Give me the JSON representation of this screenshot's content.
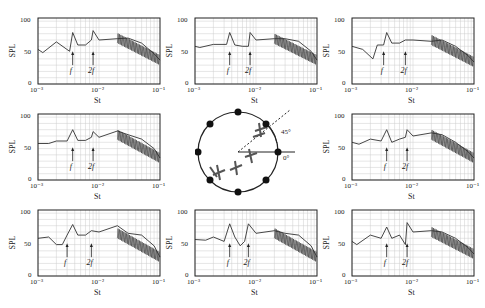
{
  "figure": {
    "xlabel": "St",
    "ylabel": "SPL",
    "yticks": [
      "0",
      "50",
      "100"
    ],
    "xticks": [
      "10⁻³",
      "10⁻²",
      "10⁻¹"
    ],
    "markers": [
      "f",
      "2f"
    ],
    "diagram": {
      "angle_label_45": "45°",
      "angle_label_0": "0°",
      "microphone_count": 8
    }
  },
  "chart_data": [
    {
      "type": "line",
      "title": "",
      "position": "top-left",
      "xlabel": "St",
      "ylabel": "SPL",
      "xscale": "log",
      "xlim": [
        0.001,
        0.1
      ],
      "ylim": [
        0,
        105
      ],
      "grid": true,
      "annotations": [
        "f",
        "2f"
      ],
      "x": [
        0.001,
        0.0012,
        0.002,
        0.0033,
        0.0037,
        0.0045,
        0.006,
        0.0075,
        0.008,
        0.01,
        0.02,
        0.03,
        0.05,
        0.08,
        0.1
      ],
      "y": [
        55,
        50,
        67,
        52,
        82,
        62,
        62,
        70,
        85,
        70,
        72,
        73,
        65,
        48,
        38
      ]
    },
    {
      "type": "line",
      "title": "",
      "position": "top-center",
      "xlabel": "St",
      "ylabel": "SPL",
      "xscale": "log",
      "xlim": [
        0.001,
        0.1
      ],
      "ylim": [
        0,
        105
      ],
      "grid": true,
      "annotations": [
        "f",
        "2f"
      ],
      "x": [
        0.001,
        0.0012,
        0.002,
        0.0033,
        0.0037,
        0.0045,
        0.006,
        0.0075,
        0.008,
        0.01,
        0.02,
        0.03,
        0.05,
        0.08,
        0.1
      ],
      "y": [
        60,
        58,
        63,
        63,
        82,
        62,
        60,
        60,
        82,
        70,
        72,
        72,
        68,
        52,
        38
      ]
    },
    {
      "type": "line",
      "title": "",
      "position": "top-right",
      "xlabel": "St",
      "ylabel": "SPL",
      "xscale": "log",
      "xlim": [
        0.001,
        0.1
      ],
      "ylim": [
        0,
        105
      ],
      "grid": true,
      "annotations": [
        "f",
        "2f"
      ],
      "x": [
        0.001,
        0.0015,
        0.0022,
        0.0026,
        0.0033,
        0.0037,
        0.0045,
        0.006,
        0.0075,
        0.01,
        0.02,
        0.03,
        0.05,
        0.08,
        0.1
      ],
      "y": [
        60,
        55,
        40,
        62,
        62,
        82,
        65,
        65,
        70,
        70,
        68,
        70,
        60,
        45,
        35
      ]
    },
    {
      "type": "line",
      "title": "",
      "position": "middle-left",
      "xlabel": "St",
      "ylabel": "SPL",
      "xscale": "log",
      "xlim": [
        0.001,
        0.1
      ],
      "ylim": [
        0,
        105
      ],
      "grid": true,
      "annotations": [
        "f",
        "2f"
      ],
      "x": [
        0.001,
        0.0015,
        0.002,
        0.003,
        0.0037,
        0.0045,
        0.006,
        0.0075,
        0.008,
        0.01,
        0.02,
        0.03,
        0.05,
        0.08,
        0.1
      ],
      "y": [
        58,
        58,
        62,
        62,
        80,
        63,
        63,
        68,
        77,
        68,
        78,
        72,
        65,
        50,
        35
      ]
    },
    {
      "type": "line",
      "title": "",
      "position": "middle-right",
      "xlabel": "St",
      "ylabel": "SPL",
      "xscale": "log",
      "xlim": [
        0.001,
        0.1
      ],
      "ylim": [
        0,
        105
      ],
      "grid": true,
      "annotations": [
        "f",
        "2f"
      ],
      "x": [
        0.001,
        0.0013,
        0.002,
        0.003,
        0.0037,
        0.0045,
        0.006,
        0.0075,
        0.008,
        0.01,
        0.02,
        0.03,
        0.05,
        0.08,
        0.1
      ],
      "y": [
        60,
        57,
        65,
        62,
        80,
        60,
        65,
        68,
        80,
        70,
        75,
        72,
        60,
        45,
        35
      ]
    },
    {
      "type": "line",
      "title": "",
      "position": "bottom-left",
      "xlabel": "St",
      "ylabel": "SPL",
      "xscale": "log",
      "xlim": [
        0.001,
        0.1
      ],
      "ylim": [
        0,
        105
      ],
      "grid": true,
      "annotations": [
        "f",
        "2f"
      ],
      "x": [
        0.001,
        0.0015,
        0.002,
        0.0025,
        0.003,
        0.0037,
        0.0045,
        0.006,
        0.0075,
        0.01,
        0.02,
        0.03,
        0.05,
        0.08,
        0.1
      ],
      "y": [
        60,
        62,
        50,
        50,
        65,
        82,
        65,
        65,
        72,
        70,
        80,
        68,
        65,
        48,
        30
      ]
    },
    {
      "type": "line",
      "title": "",
      "position": "bottom-center",
      "xlabel": "St",
      "ylabel": "SPL",
      "xscale": "log",
      "xlim": [
        0.001,
        0.1
      ],
      "ylim": [
        0,
        105
      ],
      "grid": true,
      "annotations": [
        "f",
        "2f"
      ],
      "x": [
        0.001,
        0.0015,
        0.002,
        0.003,
        0.0037,
        0.0045,
        0.0055,
        0.0065,
        0.0075,
        0.01,
        0.02,
        0.03,
        0.05,
        0.08,
        0.1
      ],
      "y": [
        58,
        57,
        62,
        55,
        83,
        62,
        48,
        55,
        83,
        68,
        72,
        68,
        65,
        48,
        30
      ]
    },
    {
      "type": "line",
      "title": "",
      "position": "bottom-right",
      "xlabel": "St",
      "ylabel": "SPL",
      "xscale": "log",
      "xlim": [
        0.001,
        0.1
      ],
      "ylim": [
        0,
        105
      ],
      "grid": true,
      "annotations": [
        "f",
        "2f"
      ],
      "x": [
        0.001,
        0.0012,
        0.002,
        0.003,
        0.0037,
        0.0045,
        0.006,
        0.0075,
        0.008,
        0.01,
        0.02,
        0.03,
        0.05,
        0.08,
        0.1
      ],
      "y": [
        55,
        50,
        65,
        60,
        78,
        60,
        65,
        50,
        85,
        70,
        72,
        70,
        60,
        45,
        35
      ]
    }
  ]
}
